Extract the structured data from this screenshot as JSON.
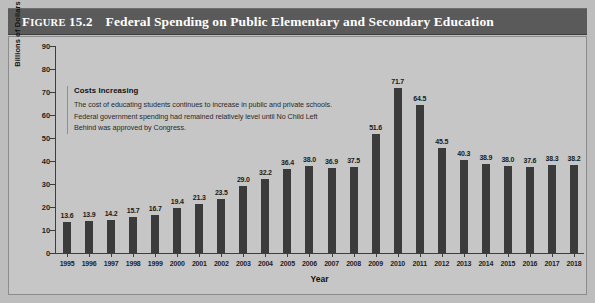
{
  "figure": {
    "number_prefix": "F",
    "number_rest": "IGURE",
    "number": "15.2",
    "title": "Federal Spending on Public Elementary and Secondary Education"
  },
  "annotation": {
    "heading": "Costs Increasing",
    "lines": [
      "The cost of educating students continues to increase in public and private schools.",
      "Federal government spending had remained relatively level until No Child Left",
      "Behind was approved by Congress."
    ]
  },
  "colors": {
    "title_bar": "#5a5a5a",
    "plot_background": "#c6c6c6",
    "bar": "#3b3b3b",
    "axis": "#3d3d3d",
    "page_background": "#bdbdbd"
  },
  "chart_data": {
    "type": "bar",
    "title": "Federal Spending on Public Elementary and Secondary Education",
    "xlabel": "Year",
    "ylabel": "Billions of Dollars",
    "ylim": [
      0,
      90
    ],
    "yticks": [
      0,
      10,
      20,
      30,
      40,
      50,
      60,
      70,
      80,
      90
    ],
    "grid": false,
    "legend": null,
    "categories": [
      "1995",
      "1996",
      "1997",
      "1998",
      "1999",
      "2000",
      "2001",
      "2002",
      "2003",
      "2004",
      "2005",
      "2006",
      "2007",
      "2008",
      "2009",
      "2010",
      "2011",
      "2012",
      "2013",
      "2014",
      "2015",
      "2016",
      "2017",
      "2018"
    ],
    "values": [
      13.6,
      13.9,
      14.2,
      15.7,
      16.7,
      19.4,
      21.3,
      23.5,
      29.0,
      32.2,
      36.4,
      38.0,
      36.9,
      37.5,
      51.6,
      71.7,
      64.5,
      45.5,
      40.3,
      38.9,
      38.0,
      37.6,
      38.3,
      38.2
    ],
    "value_labels": [
      "13.6",
      "13.9",
      "14.2",
      "15.7",
      "16.7",
      "19.4",
      "21.3",
      "23.5",
      "29.0",
      "32.2",
      "36.4",
      "38.0",
      "36.9",
      "37.5",
      "51.6",
      "71.7",
      "64.5",
      "45.5",
      "40.3",
      "38.9",
      "38.0",
      "37.6",
      "38.3",
      "38.2"
    ]
  }
}
